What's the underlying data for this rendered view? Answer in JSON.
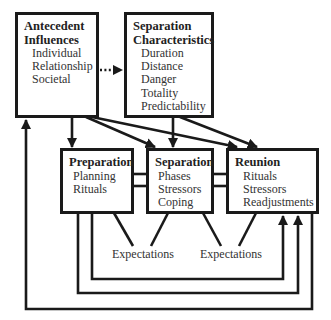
{
  "boxes": {
    "antecedent": {
      "title_lines": [
        "Antecedent",
        "Influences"
      ],
      "items": [
        "Individual",
        "Relationship",
        "Societal"
      ]
    },
    "separation_characteristics": {
      "title_lines": [
        "Separation",
        "Characteristics"
      ],
      "items": [
        "Duration",
        "Distance",
        "Danger",
        "Totality",
        "Predictability"
      ]
    },
    "preparation": {
      "title": "Preparation",
      "items": [
        "Planning",
        "Rituals"
      ]
    },
    "separation": {
      "title": "Separation",
      "items": [
        "Phases",
        "Stressors",
        "Coping"
      ]
    },
    "reunion": {
      "title": "Reunion",
      "items": [
        "Rituals",
        "Stressors",
        "Readjustments"
      ]
    }
  },
  "labels": {
    "expectations_left": "Expectations",
    "expectations_right": "Expectations"
  },
  "colors": {
    "line": "#1a1a1a",
    "text": "#333333",
    "background": "#ffffff"
  }
}
